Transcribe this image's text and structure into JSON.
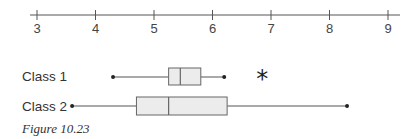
{
  "chart_data": {
    "type": "boxplot",
    "title": "",
    "xlabel": "",
    "ylabel": "",
    "xlim": [
      3,
      9
    ],
    "x_ticks": [
      3,
      4,
      5,
      6,
      7,
      8,
      9
    ],
    "x_tick_labels": [
      "3",
      "4",
      "5",
      "6",
      "7",
      "8",
      "9"
    ],
    "grid": false,
    "legend": null,
    "series": [
      {
        "name": "Class 1",
        "min": 4.3,
        "q1": 5.25,
        "median": 5.45,
        "q3": 5.8,
        "max": 6.2,
        "outliers": [
          6.85
        ],
        "outlier_marker": "*"
      },
      {
        "name": "Class 2",
        "min": 3.6,
        "q1": 4.7,
        "median": 5.25,
        "q3": 6.25,
        "max": 8.3,
        "outliers": []
      }
    ],
    "caption": "Figure 10.23"
  },
  "axis": {
    "ticks": [
      "3",
      "4",
      "5",
      "6",
      "7",
      "8",
      "9"
    ]
  },
  "labels": {
    "class1": "Class 1",
    "class2": "Class 2",
    "outlier_symbol": "*"
  },
  "caption": "Figure 10.23",
  "colors": {
    "axis": "#555555",
    "box_fill": "#ececec",
    "box_stroke": "#666666",
    "whisker": "#555555",
    "point": "#222222"
  }
}
